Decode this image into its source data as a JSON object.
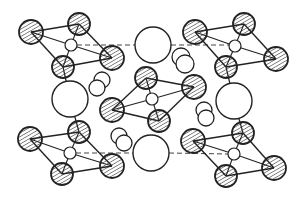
{
  "diagram": {
    "type": "crystal-structure-projection",
    "colors": {
      "stroke": "#222222",
      "fill": "#ffffff",
      "hatch": "#333333"
    },
    "clusters": [
      {
        "id": "top-left",
        "center": [
          71,
          45
        ],
        "atoms": [
          [
            31,
            32,
            12
          ],
          [
            79,
            24,
            11
          ],
          [
            112,
            58,
            12
          ],
          [
            63,
            67,
            11
          ]
        ]
      },
      {
        "id": "top-right",
        "center": [
          235,
          46
        ],
        "atoms": [
          [
            195,
            32,
            12
          ],
          [
            244,
            24,
            11
          ],
          [
            276,
            59,
            12
          ],
          [
            226,
            67,
            11
          ]
        ]
      },
      {
        "id": "center",
        "center": [
          152,
          99
        ],
        "atoms": [
          [
            146,
            78,
            11
          ],
          [
            194,
            87,
            12
          ],
          [
            159,
            121,
            11
          ],
          [
            112,
            110,
            12
          ]
        ]
      },
      {
        "id": "bottom-left",
        "center": [
          70,
          153
        ],
        "atoms": [
          [
            30,
            139,
            12
          ],
          [
            79,
            132,
            11
          ],
          [
            112,
            166,
            12
          ],
          [
            62,
            174,
            11
          ]
        ]
      },
      {
        "id": "bottom-right",
        "center": [
          234,
          154
        ],
        "atoms": [
          [
            193,
            141,
            12
          ],
          [
            243,
            133,
            11
          ],
          [
            274,
            168,
            12
          ],
          [
            226,
            176,
            11
          ]
        ]
      }
    ],
    "large_atoms": [
      [
        153,
        45,
        18
      ],
      [
        70,
        99,
        18
      ],
      [
        234,
        101,
        18
      ],
      [
        151,
        153,
        18
      ]
    ],
    "small_pairs": [
      [
        [
          102,
          80,
          8
        ],
        [
          97,
          88,
          8
        ]
      ],
      [
        [
          181,
          57,
          9
        ],
        [
          185,
          64,
          9
        ]
      ],
      [
        [
          119,
          136,
          8
        ],
        [
          124,
          143,
          8
        ]
      ],
      [
        [
          204,
          110,
          8
        ],
        [
          206,
          118,
          8
        ]
      ]
    ],
    "dashed_lines": [
      [
        77,
        45,
        135,
        45
      ],
      [
        171,
        45,
        229,
        45
      ],
      [
        76,
        153,
        133,
        153
      ],
      [
        169,
        153,
        228,
        154
      ]
    ],
    "bonds_extra": [
      [
        66,
        78,
        68,
        81
      ],
      [
        230,
        78,
        232,
        83
      ],
      [
        72,
        117,
        76,
        121
      ],
      [
        238,
        119,
        241,
        122
      ]
    ]
  }
}
